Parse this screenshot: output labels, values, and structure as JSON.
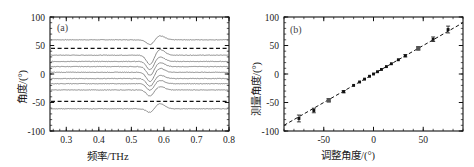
{
  "figure": {
    "panel_a_tag": "(a)",
    "panel_b_tag": "(b)"
  },
  "chart_data": [
    {
      "type": "line",
      "panel": "(a)",
      "title": "",
      "xlabel": "频率/THz",
      "ylabel": "角度/(°)",
      "xlim": [
        0.25,
        0.8
      ],
      "ylim": [
        -100,
        100
      ],
      "xticks": [
        0.3,
        0.4,
        0.5,
        0.6,
        0.7,
        0.8
      ],
      "xticklabels": [
        "0.3",
        "0.4",
        "0.5",
        "0.6",
        "0.7",
        "0.8"
      ],
      "yticks": [
        -100,
        -50,
        0,
        50,
        100
      ],
      "yticklabels": [
        "-100",
        "-50",
        "0",
        "50",
        "100"
      ],
      "grid": false,
      "legend": "none",
      "line_color": "#777777",
      "dashed_color": "#111111",
      "resonance_center_thz": 0.558,
      "series": [
        {
          "name": "trace-+60",
          "baseline": 60,
          "dip": -9,
          "bump": 7
        },
        {
          "name": "trace-+33",
          "baseline": 33,
          "dip": -17,
          "bump": 10
        },
        {
          "name": "trace-+22",
          "baseline": 22,
          "dip": -15,
          "bump": 8
        },
        {
          "name": "trace-+13",
          "baseline": 13,
          "dip": -16,
          "bump": 7
        },
        {
          "name": "trace-+3",
          "baseline": 3,
          "dip": -17,
          "bump": 7
        },
        {
          "name": "trace--8",
          "baseline": -8,
          "dip": -14,
          "bump": 6
        },
        {
          "name": "trace--17",
          "baseline": -17,
          "dip": -12,
          "bump": 6
        },
        {
          "name": "trace--28",
          "baseline": -28,
          "dip": -11,
          "bump": 6
        },
        {
          "name": "trace--61",
          "baseline": -61,
          "dip": -7,
          "bump": 9
        }
      ],
      "reference_lines": [
        {
          "name": "dashed-upper",
          "y": 45
        },
        {
          "name": "dashed-lower",
          "y": -48
        }
      ]
    },
    {
      "type": "scatter",
      "panel": "(b)",
      "title": "",
      "xlabel": "调整角度/(°)",
      "ylabel": "测量角度/(°)",
      "xlim": [
        -90,
        90
      ],
      "ylim": [
        -100,
        100
      ],
      "xticks": [
        -50,
        0,
        50
      ],
      "xticklabels": [
        "-50",
        "0",
        "50"
      ],
      "yticks": [
        -100,
        -50,
        0,
        50,
        100
      ],
      "yticklabels": [
        "-100",
        "-50",
        "0",
        "50",
        "100"
      ],
      "grid": false,
      "legend": "none",
      "marker_color": "#111111",
      "fit_color": "#111111",
      "fit": {
        "name": "linear-fit",
        "slope": 1.0,
        "intercept": 0.0,
        "style": "dashed"
      },
      "x": [
        -75,
        -60,
        -45,
        -30,
        -20,
        -14,
        -9,
        -4,
        0,
        4,
        8,
        13,
        18,
        25,
        32,
        45,
        60,
        75
      ],
      "y": [
        -78,
        -64,
        -46,
        -31,
        -20,
        -14,
        -9,
        -4,
        0,
        4,
        8,
        13,
        18,
        25,
        32,
        45,
        61,
        78
      ],
      "yerr": [
        6,
        4,
        3,
        2,
        1.5,
        1.5,
        1.5,
        1.5,
        1.5,
        1.5,
        1.5,
        1.5,
        1.5,
        1.5,
        2,
        3,
        4,
        6
      ]
    }
  ]
}
